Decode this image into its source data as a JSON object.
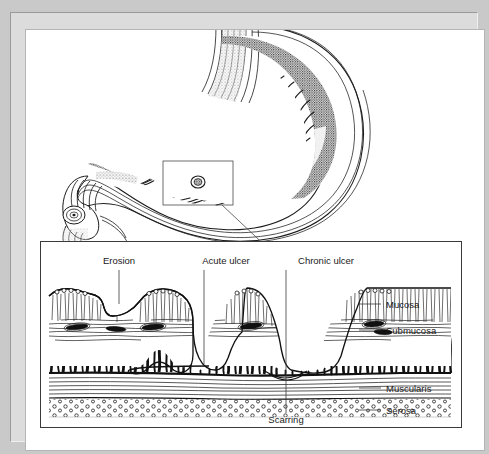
{
  "figure": {
    "watermark": "",
    "frame_color": "#c9c9c9",
    "ink_color": "#1a1a1a",
    "paper_color": "#ffffff"
  },
  "overview": {
    "name": "stomach-sagittal-section",
    "description": "Sagittal cut of stomach with esophagus, rugae and duodenum",
    "callout_label": ""
  },
  "detail": {
    "name": "gastric-wall-cross-section",
    "top_labels": [
      {
        "id": "erosion",
        "text": "Erosion",
        "x": 78,
        "y": 22,
        "leader_x": 78,
        "leader_y1": 28,
        "leader_y2": 62
      },
      {
        "id": "acute-ulcer",
        "text": "Acute ulcer",
        "x": 185,
        "y": 22,
        "leader_x": 185,
        "leader_y1": 28,
        "leader_y2": 108
      },
      {
        "id": "chronic-ulcer",
        "text": "Chronic ulcer",
        "x": 285,
        "y": 22,
        "leader_x": 285,
        "leader_y1": 28,
        "leader_y2": 143
      }
    ],
    "right_labels": [
      {
        "id": "mucosa",
        "text": "Mucosa",
        "x": 345,
        "y": 62,
        "leader_x1": 318,
        "leader_x2": 340
      },
      {
        "id": "submucosa",
        "text": "Submucosa",
        "x": 345,
        "y": 85,
        "leader_x1": 318,
        "leader_x2": 340
      },
      {
        "id": "muscularis",
        "text": "Muscularis",
        "x": 345,
        "y": 143,
        "leader_x1": 318,
        "leader_x2": 340
      },
      {
        "id": "serosa",
        "text": "Serosa",
        "x": 345,
        "y": 166,
        "leader_x1": 318,
        "leader_x2": 340
      }
    ],
    "bottom_labels": [
      {
        "id": "scarring",
        "text": "Scarring",
        "x": 240,
        "y": 179,
        "leader_x": 240,
        "leader_y1": 143,
        "leader_y2": 172
      }
    ],
    "layers": [
      {
        "id": "mucosa",
        "label": "Mucosa"
      },
      {
        "id": "submucosa",
        "label": "Submucosa"
      },
      {
        "id": "muscularis",
        "label": "Muscularis"
      },
      {
        "id": "serosa",
        "label": "Serosa"
      }
    ]
  }
}
